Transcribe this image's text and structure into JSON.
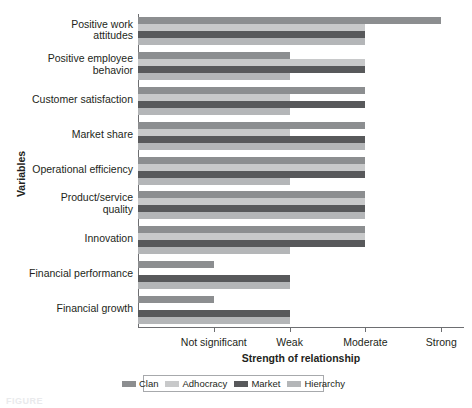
{
  "chart_data": {
    "type": "bar",
    "orientation": "horizontal",
    "title": "",
    "xlabel": "Strength of relationship",
    "ylabel": "Variables",
    "grid": false,
    "legend_position": "bottom",
    "xticklabels": [
      "Not significant",
      "Weak",
      "Moderate",
      "Strong"
    ],
    "xtickvalues": [
      1,
      2,
      3,
      4
    ],
    "xlim": [
      0,
      4.3
    ],
    "categories": [
      "Positive work\nattitudes",
      "Positive employee\nbehavior",
      "Customer satisfaction",
      "Market share",
      "Operational efficiency",
      "Product/service\nquality",
      "Innovation",
      "Financial performance",
      "Financial growth"
    ],
    "series": [
      {
        "name": "Clan",
        "color": "#8c8e90",
        "values": [
          4.0,
          2.0,
          3.0,
          3.0,
          3.0,
          3.0,
          3.0,
          1.0,
          1.0
        ]
      },
      {
        "name": "Adhocracy",
        "color": "#c8c9ca",
        "values": [
          3.0,
          3.0,
          2.0,
          2.0,
          3.0,
          3.0,
          3.0,
          0.0,
          0.0
        ]
      },
      {
        "name": "Market",
        "color": "#58595b",
        "values": [
          3.0,
          3.0,
          3.0,
          3.0,
          3.0,
          3.0,
          3.0,
          2.0,
          2.0
        ]
      },
      {
        "name": "Hierarchy",
        "color": "#b4b6b8",
        "values": [
          3.0,
          2.0,
          2.0,
          3.0,
          2.0,
          3.0,
          2.0,
          2.0,
          2.0
        ]
      }
    ]
  },
  "axis": {
    "y_title": "Variables",
    "x_title": "Strength of relationship"
  },
  "caption": "FIGURE"
}
